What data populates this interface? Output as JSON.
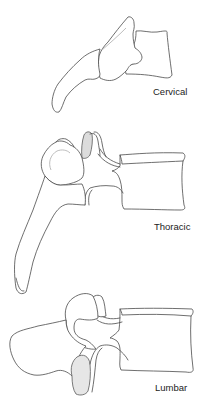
{
  "figure": {
    "colors": {
      "outline": "#4a4a4a",
      "facet_shade": "#dcdcdc",
      "lumbar_shade": "#e6e6e6",
      "background": "#ffffff",
      "label_text": "#222222"
    },
    "panels": [
      {
        "id": "cervical",
        "label": "Cervical"
      },
      {
        "id": "thoracic",
        "label": "Thoracic"
      },
      {
        "id": "lumbar",
        "label": "Lumbar"
      }
    ]
  }
}
